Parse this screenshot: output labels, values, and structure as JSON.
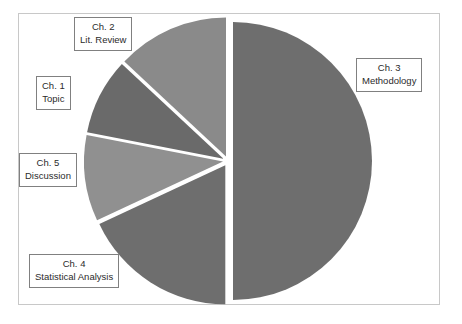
{
  "chart_data": {
    "type": "pie",
    "title": "",
    "categories": [
      "Ch. 1 Topic",
      "Ch. 2 Lit. Review",
      "Ch. 3 Methodology",
      "Ch. 4 Statistical Analysis",
      "Ch. 5 Discussion"
    ],
    "values": [
      9,
      13,
      50,
      18,
      10
    ],
    "legend_position": "callouts",
    "grid": false,
    "slices": [
      {
        "id": "ch3",
        "chapter": "Ch. 3",
        "name": "Methodology",
        "value": 50,
        "color": "#6e6e6e",
        "start_angle": 0,
        "end_angle": 180
      },
      {
        "id": "ch4",
        "chapter": "Ch. 4",
        "name": "Statistical Analysis",
        "value": 18,
        "color": "#6e6e6e",
        "start_angle": 180,
        "end_angle": 245
      },
      {
        "id": "ch5",
        "chapter": "Ch. 5",
        "name": "Discussion",
        "value": 10,
        "color": "#909090",
        "start_angle": 245,
        "end_angle": 281
      },
      {
        "id": "ch1",
        "chapter": "Ch. 1",
        "name": "Topic",
        "value": 9,
        "color": "#6a6a6a",
        "start_angle": 281,
        "end_angle": 313
      },
      {
        "id": "ch2",
        "chapter": "Ch. 2",
        "name": "Lit. Review",
        "value": 13,
        "color": "#8a8a8a",
        "start_angle": 313,
        "end_angle": 360
      }
    ],
    "geometry": {
      "center_x": 228,
      "center_y": 161,
      "radius": 139,
      "explode_offset": 5
    },
    "colors": {
      "dark_gray": "#6e6e6e",
      "mid_gray": "#8a8a8a",
      "light_gray": "#909090",
      "frame_border": "#c8c8c8",
      "callout_border": "#808080",
      "background": "#ffffff",
      "text": "#2b2b2b"
    }
  },
  "callouts": {
    "ch1": {
      "line1": "Ch. 1",
      "line2": "Topic"
    },
    "ch2": {
      "line1": "Ch. 2",
      "line2": "Lit. Review"
    },
    "ch3": {
      "line1": "Ch. 3",
      "line2": "Methodology"
    },
    "ch4": {
      "line1": "Ch. 4",
      "line2": "Statistical Analysis"
    },
    "ch5": {
      "line1": "Ch. 5",
      "line2": "Discussion"
    }
  }
}
